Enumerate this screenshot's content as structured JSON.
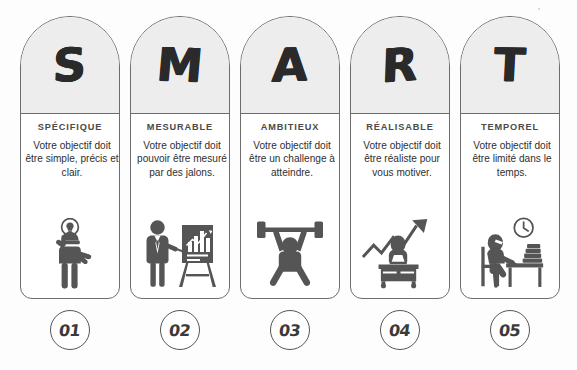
{
  "panels": [
    {
      "letter": "S",
      "title": "SPÉCIFIQUE",
      "description": "Votre objectif doit être simple, précis et clair.",
      "number": "01",
      "icon": "person-with-idea-lightbulb-icon"
    },
    {
      "letter": "M",
      "title": "MESURABLE",
      "description": "Votre objectif doit pouvoir être mesuré par des jalons.",
      "number": "02",
      "icon": "presenter-with-bar-chart-easel-icon"
    },
    {
      "letter": "A",
      "title": "AMBITIEUX",
      "description": "Votre objectif doit être un challenge à atteindre.",
      "number": "03",
      "icon": "weightlifter-barbell-icon"
    },
    {
      "letter": "R",
      "title": "RÉALISABLE",
      "description": "Votre objectif doit être réaliste pour vous motiver.",
      "number": "04",
      "icon": "person-at-desk-with-rising-arrow-icon"
    },
    {
      "letter": "T",
      "title": "TEMPOREL",
      "description": "Votre objectif doit être limité dans le temps.",
      "number": "05",
      "icon": "person-studying-with-clock-and-books-icon"
    }
  ],
  "colors": {
    "panel_head_fill": "#ededed",
    "panel_border": "#6d6d6d",
    "letter_color": "#2a2a2a",
    "title_color": "#4a4a4a",
    "body_text_color": "#2f2f2f",
    "icon_color": "#555555",
    "number_circle_border": "#555555",
    "background": "#ffffff"
  }
}
